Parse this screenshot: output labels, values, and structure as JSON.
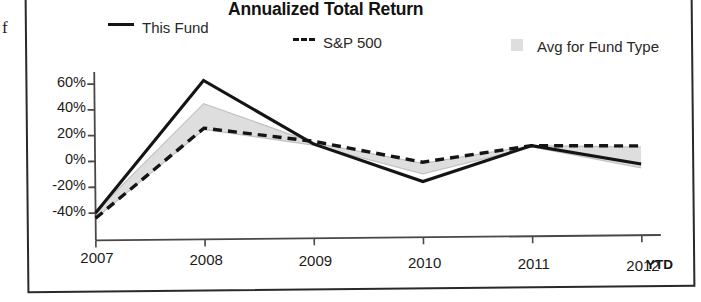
{
  "page": {
    "margin_glyph": "f"
  },
  "chart_data": {
    "type": "line",
    "title": "Annualized Total Return",
    "xlabel": "",
    "ylabel": "",
    "categories": [
      "2007",
      "2008",
      "2009",
      "2010",
      "2011",
      "2012"
    ],
    "x_tick_labels": [
      "2007",
      "2008",
      "2009",
      "2010",
      "2011",
      "2012"
    ],
    "x_axis_note": "YTD",
    "y_tick_labels": [
      "60%",
      "40%",
      "20%",
      "0%",
      "-20%",
      "-40%"
    ],
    "y_ticks": [
      60,
      40,
      20,
      0,
      -20,
      -40
    ],
    "ylim": [
      -50,
      70
    ],
    "y_unit": "%",
    "grid": false,
    "legend_position": "top",
    "series": [
      {
        "name": "This Fund",
        "style": "solid",
        "color": "#151413",
        "values": [
          -40,
          62,
          12,
          -18,
          9,
          -6
        ]
      },
      {
        "name": "S&P 500",
        "style": "dashed",
        "color": "#151413",
        "values": [
          -44,
          25,
          14,
          -3,
          9,
          8
        ]
      },
      {
        "name": "Avg for Fund Type",
        "style": "band",
        "color": "#dedede",
        "upper": [
          -39,
          44,
          13,
          -4,
          9,
          7
        ],
        "lower": [
          -44,
          24,
          11,
          -12,
          8,
          -9
        ]
      }
    ],
    "legend": [
      {
        "label": "This Fund",
        "marker": "solid-line"
      },
      {
        "label": "S&P 500",
        "marker": "dashed-line"
      },
      {
        "label": "Avg for Fund Type",
        "marker": "gray-swatch"
      }
    ],
    "colors": {
      "line": "#151413",
      "band": "#dedede",
      "axis": "#4a4846",
      "text": "#1c1b1a"
    }
  }
}
